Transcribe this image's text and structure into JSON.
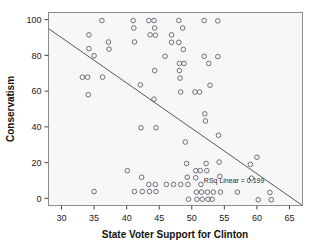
{
  "chart_data": {
    "type": "scatter",
    "title": "",
    "xlabel": "State Voter Support for Clinton",
    "ylabel": "Conservatism",
    "xlim": [
      28,
      67
    ],
    "ylim": [
      -4,
      104
    ],
    "xticks": [
      30,
      35,
      40,
      45,
      50,
      55,
      60,
      65
    ],
    "yticks": [
      0,
      20,
      40,
      60,
      80,
      100
    ],
    "grid": false,
    "legend": "none",
    "annotations": [
      {
        "text": "RSq Linear = 0.199",
        "x": 56.5,
        "y": 8.5
      }
    ],
    "fit_line": {
      "type": "linear",
      "r_squared": 0.199,
      "x_start": 28,
      "y_start": 95,
      "x_end": 67,
      "y_end": -4
    },
    "points": [
      {
        "x": 33.2,
        "y": 67.8
      },
      {
        "x": 34.0,
        "y": 67.8
      },
      {
        "x": 34.2,
        "y": 91.5
      },
      {
        "x": 34.2,
        "y": 83.8
      },
      {
        "x": 34.1,
        "y": 58.0
      },
      {
        "x": 35.0,
        "y": 79.8
      },
      {
        "x": 35.0,
        "y": 3.8
      },
      {
        "x": 36.2,
        "y": 99.5
      },
      {
        "x": 36.3,
        "y": 67.8
      },
      {
        "x": 37.2,
        "y": 87.5
      },
      {
        "x": 37.3,
        "y": 83.5
      },
      {
        "x": 40.1,
        "y": 15.5
      },
      {
        "x": 41.0,
        "y": 99.5
      },
      {
        "x": 41.1,
        "y": 95.3
      },
      {
        "x": 41.2,
        "y": 87.5
      },
      {
        "x": 41.2,
        "y": 3.8
      },
      {
        "x": 42.1,
        "y": 63.5
      },
      {
        "x": 42.2,
        "y": 39.5
      },
      {
        "x": 42.3,
        "y": 11.8
      },
      {
        "x": 42.4,
        "y": 3.8
      },
      {
        "x": 43.4,
        "y": 99.5
      },
      {
        "x": 43.6,
        "y": 91.5
      },
      {
        "x": 43.4,
        "y": 7.8
      },
      {
        "x": 43.5,
        "y": 3.8
      },
      {
        "x": 44.2,
        "y": 99.5
      },
      {
        "x": 44.3,
        "y": 95.3
      },
      {
        "x": 44.4,
        "y": 91.3
      },
      {
        "x": 44.3,
        "y": 71.5
      },
      {
        "x": 44.2,
        "y": 55.5
      },
      {
        "x": 44.5,
        "y": 39.5
      },
      {
        "x": 44.4,
        "y": 7.8
      },
      {
        "x": 44.5,
        "y": 3.8
      },
      {
        "x": 45.9,
        "y": 79.5
      },
      {
        "x": 46.1,
        "y": 7.8
      },
      {
        "x": 46.9,
        "y": 91.5
      },
      {
        "x": 46.9,
        "y": 87.3
      },
      {
        "x": 47.2,
        "y": 7.8
      },
      {
        "x": 48.0,
        "y": 99.5
      },
      {
        "x": 48.0,
        "y": 87.3
      },
      {
        "x": 48.1,
        "y": 75.5
      },
      {
        "x": 48.1,
        "y": 71.5
      },
      {
        "x": 48.2,
        "y": 67.3
      },
      {
        "x": 48.3,
        "y": 59.5
      },
      {
        "x": 48.3,
        "y": 7.8
      },
      {
        "x": 48.6,
        "y": 95.3
      },
      {
        "x": 48.7,
        "y": 83.3
      },
      {
        "x": 48.8,
        "y": 75.5
      },
      {
        "x": 49.0,
        "y": 31.5
      },
      {
        "x": 49.2,
        "y": 19.5
      },
      {
        "x": 49.3,
        "y": 11.8
      },
      {
        "x": 49.4,
        "y": 7.8
      },
      {
        "x": 49.5,
        "y": -0.5
      },
      {
        "x": 50.5,
        "y": 59.5
      },
      {
        "x": 50.6,
        "y": 15.5
      },
      {
        "x": 50.6,
        "y": 11.5
      },
      {
        "x": 50.7,
        "y": 3.5
      },
      {
        "x": 50.8,
        "y": -0.5
      },
      {
        "x": 51.2,
        "y": 59.5
      },
      {
        "x": 51.3,
        "y": 15.5
      },
      {
        "x": 51.4,
        "y": 7.8
      },
      {
        "x": 51.5,
        "y": 3.5
      },
      {
        "x": 51.6,
        "y": -0.5
      },
      {
        "x": 51.9,
        "y": 99.5
      },
      {
        "x": 51.9,
        "y": 79.5
      },
      {
        "x": 52.0,
        "y": 47.3
      },
      {
        "x": 52.1,
        "y": 43.3
      },
      {
        "x": 52.2,
        "y": 19.5
      },
      {
        "x": 52.3,
        "y": 15.5
      },
      {
        "x": 52.4,
        "y": 3.5
      },
      {
        "x": 52.5,
        "y": -0.5
      },
      {
        "x": 52.6,
        "y": 75.5
      },
      {
        "x": 52.8,
        "y": 63.3
      },
      {
        "x": 53.1,
        "y": -0.5
      },
      {
        "x": 53.3,
        "y": 3.5
      },
      {
        "x": 54.0,
        "y": 99.3
      },
      {
        "x": 54.0,
        "y": 79.3
      },
      {
        "x": 54.1,
        "y": 35.3
      },
      {
        "x": 54.2,
        "y": 20.3
      },
      {
        "x": 54.3,
        "y": 12.3
      },
      {
        "x": 54.4,
        "y": 3.5
      },
      {
        "x": 57.0,
        "y": 3.5
      },
      {
        "x": 59.0,
        "y": 19.0
      },
      {
        "x": 59.2,
        "y": 11.3
      },
      {
        "x": 60.0,
        "y": 23.0
      },
      {
        "x": 60.2,
        "y": -0.8
      },
      {
        "x": 62.0,
        "y": 3.3
      },
      {
        "x": 62.2,
        "y": -0.8
      }
    ]
  }
}
